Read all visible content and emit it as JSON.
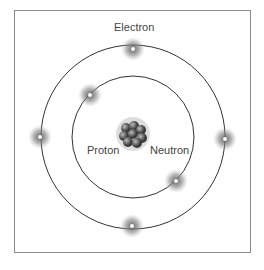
{
  "labels": {
    "electron": "Electron",
    "proton": "Proton",
    "neutron": "Neutron"
  },
  "orbits": [
    {
      "name": "inner",
      "radius": 62
    },
    {
      "name": "outer",
      "radius": 92
    }
  ],
  "electrons": [
    {
      "orbit": "outer",
      "x": 133,
      "y": 49
    },
    {
      "orbit": "inner",
      "x": 90,
      "y": 95
    },
    {
      "orbit": "outer",
      "x": 40,
      "y": 137
    },
    {
      "orbit": "outer",
      "x": 225,
      "y": 139
    },
    {
      "orbit": "inner",
      "x": 176,
      "y": 181
    },
    {
      "orbit": "outer",
      "x": 132,
      "y": 226
    }
  ],
  "colors": {
    "line": "#333333",
    "frame": "#8a8a8a",
    "glow": "#777777",
    "text": "#444444"
  }
}
